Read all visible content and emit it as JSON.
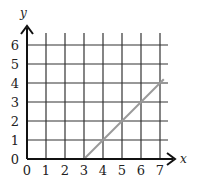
{
  "chart_data": {
    "type": "line",
    "title": "",
    "xlabel": "x",
    "ylabel": "y",
    "xlim": [
      0,
      7
    ],
    "ylim": [
      0,
      6
    ],
    "grid": true,
    "x_ticks": [
      "0",
      "1",
      "2",
      "3",
      "4",
      "5",
      "6",
      "7"
    ],
    "y_ticks": [
      "0",
      "1",
      "2",
      "3",
      "4",
      "5",
      "6"
    ],
    "series": [
      {
        "name": "line",
        "color": "#9a9a9a",
        "x": [
          3,
          4,
          5,
          6,
          7,
          7.2
        ],
        "y": [
          0,
          1,
          2,
          3,
          4,
          4.2
        ]
      }
    ]
  },
  "labels": {
    "x_axis": "x",
    "y_axis": "y"
  }
}
